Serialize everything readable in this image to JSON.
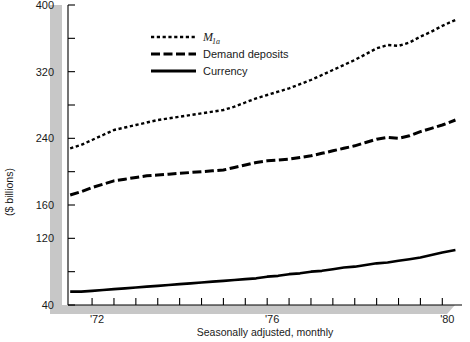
{
  "chart_data": {
    "type": "line",
    "title": "",
    "subtitle": "",
    "xlabel": "Seasonally adjusted, monthly",
    "ylabel": "($ billions)",
    "ylim": [
      40,
      400
    ],
    "xlim": [
      1971.45,
      1980.45
    ],
    "grid": false,
    "legend_position": "top-center",
    "y_ticks": [
      40,
      80,
      120,
      160,
      200,
      240,
      280,
      320,
      360,
      400
    ],
    "y_tick_labels": [
      "40",
      "",
      "120",
      "160",
      "",
      "240",
      "",
      "320",
      "",
      "400"
    ],
    "x_ticks": [
      1972,
      1972.5,
      1973,
      1973.5,
      1974,
      1974.5,
      1975,
      1975.5,
      1976,
      1976.5,
      1977,
      1977.5,
      1978,
      1978.5,
      1979,
      1979.5,
      1980
    ],
    "x_tick_labels": [
      "'72",
      "",
      "",
      "",
      "",
      "",
      "",
      "",
      "'76",
      "",
      "",
      "",
      "",
      "",
      "",
      "",
      "'80"
    ],
    "series": [
      {
        "name": "M1a",
        "name_display": "M",
        "name_subscript": "1a",
        "style": "dotted",
        "color": "#000000",
        "x": [
          1971.5,
          1971.75,
          1972.0,
          1972.25,
          1972.5,
          1972.75,
          1973.0,
          1973.25,
          1973.5,
          1973.75,
          1974.0,
          1974.25,
          1974.5,
          1974.75,
          1975.0,
          1975.25,
          1975.5,
          1975.75,
          1976.0,
          1976.25,
          1976.5,
          1976.75,
          1977.0,
          1977.25,
          1977.5,
          1977.75,
          1978.0,
          1978.25,
          1978.5,
          1978.75,
          1979.0,
          1979.25,
          1979.5,
          1979.75,
          1980.0,
          1980.3
        ],
        "values": [
          228,
          232,
          238,
          244,
          250,
          253,
          256,
          259,
          262,
          264,
          266,
          268,
          270,
          272,
          274,
          278,
          283,
          288,
          292,
          296,
          300,
          305,
          310,
          316,
          322,
          328,
          334,
          341,
          348,
          352,
          351,
          355,
          362,
          368,
          375,
          382
        ]
      },
      {
        "name": "Demand deposits",
        "style": "dashed",
        "color": "#000000",
        "x": [
          1971.5,
          1971.75,
          1972.0,
          1972.25,
          1972.5,
          1972.75,
          1973.0,
          1973.25,
          1973.5,
          1973.75,
          1974.0,
          1974.25,
          1974.5,
          1974.75,
          1975.0,
          1975.25,
          1975.5,
          1975.75,
          1976.0,
          1976.25,
          1976.5,
          1976.75,
          1977.0,
          1977.25,
          1977.5,
          1977.75,
          1978.0,
          1978.25,
          1978.5,
          1978.75,
          1979.0,
          1979.25,
          1979.5,
          1979.75,
          1980.0,
          1980.3
        ],
        "values": [
          172,
          176,
          181,
          185,
          189,
          191,
          193,
          195,
          196,
          197,
          198,
          199,
          200,
          201,
          202,
          205,
          208,
          211,
          213,
          214,
          215,
          217,
          219,
          222,
          225,
          228,
          231,
          235,
          239,
          241,
          240,
          243,
          248,
          252,
          256,
          262
        ]
      },
      {
        "name": "Currency",
        "style": "solid",
        "color": "#000000",
        "x": [
          1971.5,
          1971.75,
          1972.0,
          1972.25,
          1972.5,
          1972.75,
          1973.0,
          1973.25,
          1973.5,
          1973.75,
          1974.0,
          1974.25,
          1974.5,
          1974.75,
          1975.0,
          1975.25,
          1975.5,
          1975.75,
          1976.0,
          1976.25,
          1976.5,
          1976.75,
          1977.0,
          1977.25,
          1977.5,
          1977.75,
          1978.0,
          1978.25,
          1978.5,
          1978.75,
          1979.0,
          1979.25,
          1979.5,
          1979.75,
          1980.0,
          1980.3
        ],
        "values": [
          56,
          56,
          57,
          58,
          59,
          60,
          61,
          62,
          63,
          64,
          65,
          66,
          67,
          68,
          69,
          70,
          71,
          72,
          74,
          75,
          77,
          78,
          80,
          81,
          83,
          85,
          86,
          88,
          90,
          91,
          93,
          95,
          97,
          100,
          103,
          106
        ]
      }
    ],
    "legend": [
      {
        "label": "M1a",
        "style": "dotted"
      },
      {
        "label": "Demand deposits",
        "style": "dashed"
      },
      {
        "label": "Currency",
        "style": "solid"
      }
    ]
  },
  "colors": {
    "ink": "#000000",
    "shadow": "#c0c0c0",
    "axis": "#000000"
  },
  "legend_text": {
    "m1a_base": "M",
    "m1a_sub": "1a",
    "demand": "Demand deposits",
    "currency": "Currency"
  },
  "axis_text": {
    "y_title": "($ billions)",
    "x_title": "Seasonally adjusted, monthly",
    "y_labels": [
      "400",
      "320",
      "240",
      "160",
      "120",
      "40"
    ],
    "x_labels": [
      "'72",
      "'76",
      "'80"
    ]
  }
}
